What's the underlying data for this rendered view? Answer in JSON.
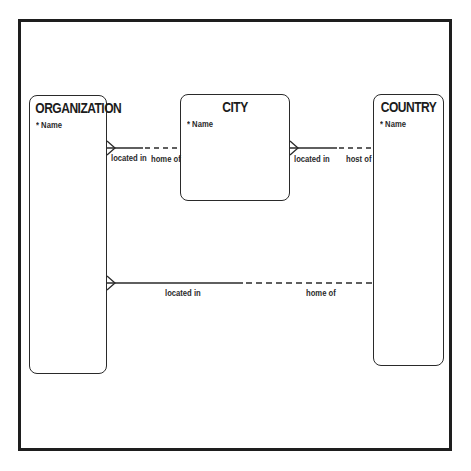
{
  "diagram": {
    "type": "entity-relationship",
    "entities": [
      {
        "id": "organization",
        "title": "ORGANIZATION",
        "attributes": [
          {
            "marker": "*",
            "name": "Name"
          }
        ]
      },
      {
        "id": "city",
        "title": "CITY",
        "attributes": [
          {
            "marker": "*",
            "name": "Name"
          }
        ]
      },
      {
        "id": "country",
        "title": "COUNTRY",
        "attributes": [
          {
            "marker": "*",
            "name": "Name"
          }
        ]
      }
    ],
    "relationships": [
      {
        "from": "organization",
        "to": "city",
        "from_label": "located in",
        "to_label": "home of",
        "from_cardinality": "many",
        "from_optionality": "mandatory",
        "to_optionality": "optional"
      },
      {
        "from": "city",
        "to": "country",
        "from_label": "located in",
        "to_label": "host of",
        "from_cardinality": "many",
        "from_optionality": "mandatory",
        "to_optionality": "optional"
      },
      {
        "from": "organization",
        "to": "country",
        "from_label": "located in",
        "to_label": "home of",
        "from_cardinality": "many",
        "from_optionality": "mandatory",
        "to_optionality": "optional"
      }
    ]
  },
  "labels": {
    "org_title": "ORGANIZATION",
    "org_attr": "* Name",
    "city_title": "CITY",
    "city_attr": "* Name",
    "country_title": "COUNTRY",
    "country_attr": "* Name",
    "rel1_from": "located in",
    "rel1_to": "home of",
    "rel2_from": "located in",
    "rel2_to": "host of",
    "rel3_from": "located in",
    "rel3_to": "home of"
  }
}
